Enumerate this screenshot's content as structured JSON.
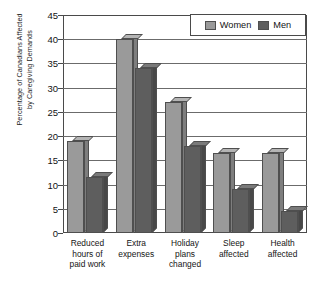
{
  "chart_data": {
    "type": "bar",
    "title": "",
    "subtitle": "",
    "xlabel": "",
    "ylabel": "Percentage of Canadians Affected\nby Caregiving Demands",
    "ylim": [
      0,
      45
    ],
    "ytick_step": 5,
    "yticks": [
      45,
      40,
      35,
      30,
      25,
      20,
      15,
      10,
      5,
      0
    ],
    "grid": true,
    "legend_position": "top-right",
    "categories": [
      "Reduced\nhours of\npaid work",
      "Extra\nexpenses",
      "Holiday\nplans\nchanged",
      "Sleep\naffected",
      "Health\naffected"
    ],
    "series": [
      {
        "name": "Women",
        "color": "#9a9a9a",
        "values": [
          19,
          40,
          27,
          16.5,
          16.5
        ]
      },
      {
        "name": "Men",
        "color": "#5e5e5e",
        "values": [
          11.5,
          34,
          18,
          9,
          4.5
        ]
      }
    ]
  },
  "legend": {
    "items": [
      {
        "label": "Women",
        "color": "#9a9a9a"
      },
      {
        "label": "Men",
        "color": "#5e5e5e"
      }
    ]
  },
  "colors": {
    "women_fill": "#9a9a9a",
    "women_top": "#b4b4b4",
    "women_side": "#7e7e7e",
    "men_fill": "#5e5e5e",
    "men_top": "#7a7a7a",
    "men_side": "#484848",
    "axis": "#4a4a4a",
    "grid": "#6b6b6b",
    "background": "#ffffff"
  }
}
